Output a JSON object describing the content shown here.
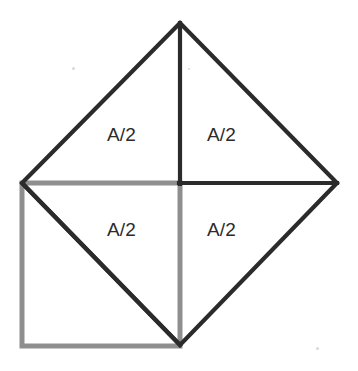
{
  "figure": {
    "title_fragment_left": "g",
    "title_fragment_right": "g",
    "colors": {
      "outline_black": "#2b2b2b",
      "square_gray": "#8f8f8f",
      "background": "#ffffff",
      "label_text": "#2b2b2b"
    },
    "stroke_widths": {
      "diamond": 4.2,
      "inner_black": 4.2,
      "gray_square": 5.0
    },
    "geometry": {
      "diamond_vertices": {
        "top": [
          180,
          23
        ],
        "right": [
          337,
          183
        ],
        "bottom": [
          180,
          345
        ],
        "left": [
          22,
          183
        ]
      },
      "gray_square": {
        "top_left": [
          22,
          183
        ],
        "bottom_right": [
          180,
          346
        ],
        "width": 158,
        "height": 163
      },
      "inner_lines": [
        {
          "name": "vertical-apex-to-center",
          "from": [
            180,
            23
          ],
          "to": [
            180,
            183
          ]
        },
        {
          "name": "horizontal-center-to-right",
          "from": [
            180,
            183
          ],
          "to": [
            337,
            183
          ]
        },
        {
          "name": "diagonal-gray-square",
          "from": [
            22,
            183
          ],
          "to": [
            180,
            345
          ]
        }
      ]
    },
    "labels": [
      {
        "id": "top-left",
        "text": "A/2",
        "x": 107,
        "y": 124
      },
      {
        "id": "top-right",
        "text": "A/2",
        "x": 207,
        "y": 124
      },
      {
        "id": "bottom-left",
        "text": "A/2",
        "x": 107,
        "y": 219
      },
      {
        "id": "bottom-right",
        "text": "A/2",
        "x": 207,
        "y": 219
      }
    ],
    "specks": [
      {
        "x": 72,
        "y": 67,
        "size": 3
      },
      {
        "x": 188,
        "y": 68,
        "size": 2
      },
      {
        "x": 316,
        "y": 347,
        "size": 3
      }
    ]
  }
}
